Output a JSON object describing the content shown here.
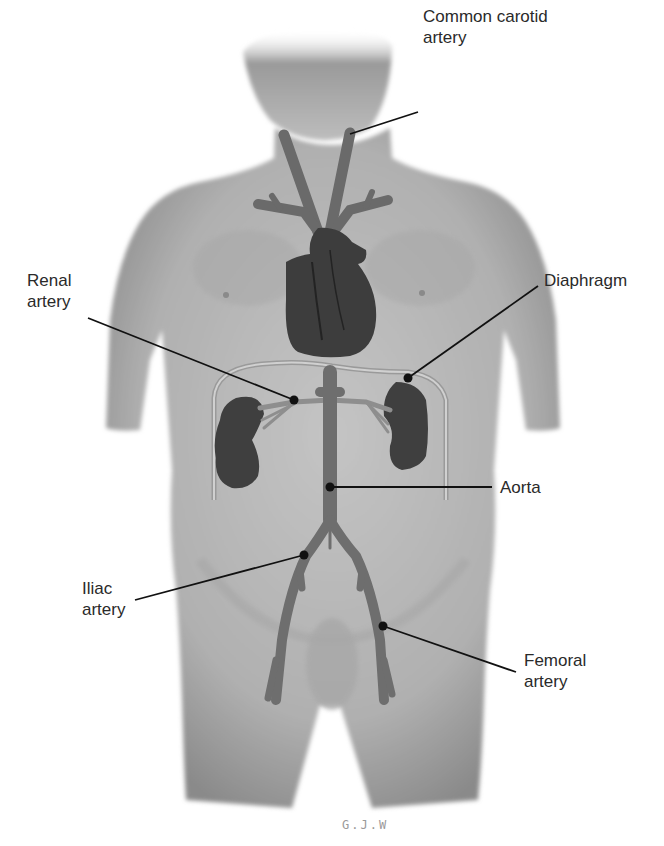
{
  "figure": {
    "type": "anatomical-diagram",
    "signature": "G.J.W",
    "colors": {
      "background": "#ffffff",
      "skin": "#b9b9b9",
      "skin_shadow": "#8f8f8f",
      "organ": "#3d3d3d",
      "vessel": "#6a6a6a",
      "leader_line": "#111111",
      "label_text": "#2a2a2a"
    }
  },
  "labels": [
    {
      "id": "common-carotid-artery",
      "text": "Common carotid\nartery",
      "side": "right",
      "x": 423,
      "y": 34,
      "anchor": {
        "x": 348,
        "y": 134
      },
      "line_start": {
        "x": 418,
        "y": 112
      }
    },
    {
      "id": "diaphragm",
      "text": "Diaphragm",
      "side": "right",
      "x": 544,
      "y": 276,
      "anchor": {
        "x": 408,
        "y": 378
      },
      "line_start": {
        "x": 538,
        "y": 286
      }
    },
    {
      "id": "renal-artery",
      "text": "Renal\nartery",
      "side": "left",
      "x": 27,
      "y": 297,
      "anchor": {
        "x": 294,
        "y": 400
      },
      "line_start": {
        "x": 88,
        "y": 318
      }
    },
    {
      "id": "aorta",
      "text": "Aorta",
      "side": "right",
      "x": 500,
      "y": 484,
      "anchor": {
        "x": 330,
        "y": 487
      },
      "line_start": {
        "x": 492,
        "y": 487
      }
    },
    {
      "id": "iliac-artery",
      "text": "Iliac\nartery",
      "side": "left",
      "x": 82,
      "y": 582,
      "anchor": {
        "x": 304,
        "y": 555
      },
      "line_start": {
        "x": 135,
        "y": 600
      }
    },
    {
      "id": "femoral-artery",
      "text": "Femoral\nartery",
      "side": "right",
      "x": 524,
      "y": 654,
      "anchor": {
        "x": 383,
        "y": 626
      },
      "line_start": {
        "x": 516,
        "y": 672
      }
    }
  ],
  "structures": [
    "head",
    "neck",
    "torso",
    "arms",
    "thighs",
    "common carotid arteries",
    "aortic arch",
    "heart",
    "diaphragm",
    "kidneys",
    "renal arteries",
    "abdominal aorta",
    "iliac arteries",
    "femoral arteries"
  ]
}
